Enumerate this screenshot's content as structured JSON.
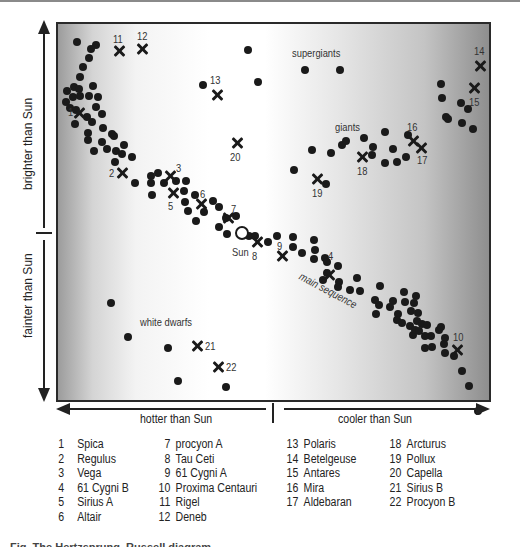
{
  "chart_data": {
    "type": "scatter",
    "title": "Hertzsprung–Russell diagram",
    "xlabel_left": "hotter than Sun",
    "xlabel_right": "cooler than Sun",
    "ylabel_top": "brighter than Sun",
    "ylabel_bottom": "fainter than Sun",
    "grid": false,
    "region_labels": [
      {
        "text": "supergiants",
        "x": 292,
        "y": 47
      },
      {
        "text": "giants",
        "x": 335,
        "y": 121
      },
      {
        "text": "white dwarfs",
        "x": 140,
        "y": 316
      },
      {
        "text": "main sequence",
        "x": 303,
        "y": 270
      }
    ],
    "sun": {
      "label": "Sun",
      "x": 242,
      "y": 233,
      "label_x": 232,
      "label_y": 246
    },
    "named_stars": [
      {
        "id": 1,
        "name": "Spica",
        "x": 79,
        "y": 113,
        "lx": 68,
        "ly": 106
      },
      {
        "id": 2,
        "name": "Regulus",
        "x": 122,
        "y": 173,
        "lx": 109,
        "ly": 167
      },
      {
        "id": 3,
        "name": "Vega",
        "x": 170,
        "y": 176,
        "lx": 176,
        "ly": 162
      },
      {
        "id": 4,
        "name": "61 Cygni B",
        "x": 329,
        "y": 275,
        "lx": 328,
        "ly": 250
      },
      {
        "id": 5,
        "name": "Sirius A",
        "x": 173,
        "y": 193,
        "lx": 168,
        "ly": 200
      },
      {
        "id": 6,
        "name": "Altair",
        "x": 201,
        "y": 204,
        "lx": 200,
        "ly": 188
      },
      {
        "id": 7,
        "name": "procyon A",
        "x": 228,
        "y": 218,
        "lx": 231,
        "ly": 203
      },
      {
        "id": 8,
        "name": "Tau Ceti",
        "x": 257,
        "y": 242,
        "lx": 252,
        "ly": 250
      },
      {
        "id": 9,
        "name": "61 Cygni A",
        "x": 282,
        "y": 256,
        "lx": 277,
        "ly": 240
      },
      {
        "id": 10,
        "name": "Proxima Centauri",
        "x": 457,
        "y": 350,
        "lx": 453,
        "ly": 331
      },
      {
        "id": 11,
        "name": "Rigel",
        "x": 119,
        "y": 51,
        "lx": 113,
        "ly": 33
      },
      {
        "id": 12,
        "name": "Deneb",
        "x": 142,
        "y": 49,
        "lx": 137,
        "ly": 30
      },
      {
        "id": 13,
        "name": "Polaris",
        "x": 217,
        "y": 95,
        "lx": 210,
        "ly": 74
      },
      {
        "id": 14,
        "name": "Betelgeuse",
        "x": 480,
        "y": 66,
        "lx": 474,
        "ly": 45
      },
      {
        "id": 15,
        "name": "Antares",
        "x": 474,
        "y": 88,
        "lx": 469,
        "ly": 96
      },
      {
        "id": 16,
        "name": "Mira",
        "x": 413,
        "y": 141,
        "lx": 407,
        "ly": 121
      },
      {
        "id": 17,
        "name": "Aldebaran",
        "x": 421,
        "y": 148,
        "lx": 417,
        "ly": 154
      },
      {
        "id": 18,
        "name": "Arcturus",
        "x": 362,
        "y": 157,
        "lx": 357,
        "ly": 165
      },
      {
        "id": 19,
        "name": "Pollux",
        "x": 317,
        "y": 179,
        "lx": 312,
        "ly": 187
      },
      {
        "id": 20,
        "name": "Capella",
        "x": 237,
        "y": 143,
        "lx": 230,
        "ly": 151
      },
      {
        "id": 21,
        "name": "Sirius B",
        "x": 197,
        "y": 346,
        "lx": 205,
        "ly": 340
      },
      {
        "id": 22,
        "name": "Procyon B",
        "x": 218,
        "y": 367,
        "lx": 226,
        "ly": 361
      }
    ],
    "other_stars": [
      [
        77,
        42
      ],
      [
        96,
        45
      ],
      [
        91,
        49
      ],
      [
        89,
        58
      ],
      [
        83,
        67
      ],
      [
        80,
        77
      ],
      [
        74,
        87
      ],
      [
        67,
        91
      ],
      [
        79,
        89
      ],
      [
        93,
        86
      ],
      [
        66,
        102
      ],
      [
        73,
        97
      ],
      [
        80,
        96
      ],
      [
        89,
        96
      ],
      [
        98,
        97
      ],
      [
        70,
        108
      ],
      [
        76,
        110
      ],
      [
        96,
        107
      ],
      [
        102,
        114
      ],
      [
        87,
        117
      ],
      [
        92,
        122
      ],
      [
        75,
        124
      ],
      [
        88,
        133
      ],
      [
        103,
        128
      ],
      [
        112,
        134
      ],
      [
        88,
        140
      ],
      [
        102,
        142
      ],
      [
        114,
        136
      ],
      [
        94,
        151
      ],
      [
        107,
        149
      ],
      [
        116,
        151
      ],
      [
        124,
        145
      ],
      [
        122,
        154
      ],
      [
        132,
        157
      ],
      [
        115,
        162
      ],
      [
        135,
        183
      ],
      [
        151,
        176
      ],
      [
        158,
        173
      ],
      [
        151,
        183
      ],
      [
        164,
        183
      ],
      [
        176,
        181
      ],
      [
        186,
        181
      ],
      [
        184,
        191
      ],
      [
        195,
        195
      ],
      [
        152,
        195
      ],
      [
        185,
        202
      ],
      [
        213,
        201
      ],
      [
        188,
        211
      ],
      [
        204,
        212
      ],
      [
        219,
        207
      ],
      [
        226,
        218
      ],
      [
        236,
        216
      ],
      [
        196,
        221
      ],
      [
        219,
        227
      ],
      [
        227,
        234
      ],
      [
        249,
        236
      ],
      [
        255,
        236
      ],
      [
        277,
        236
      ],
      [
        268,
        242
      ],
      [
        293,
        237
      ],
      [
        293,
        247
      ],
      [
        302,
        253
      ],
      [
        315,
        250
      ],
      [
        314,
        259
      ],
      [
        314,
        240
      ],
      [
        325,
        258
      ],
      [
        327,
        262
      ],
      [
        327,
        273
      ],
      [
        323,
        280
      ],
      [
        338,
        266
      ],
      [
        339,
        282
      ],
      [
        338,
        287
      ],
      [
        350,
        290
      ],
      [
        357,
        278
      ],
      [
        360,
        291
      ],
      [
        380,
        286
      ],
      [
        379,
        305
      ],
      [
        393,
        301
      ],
      [
        404,
        292
      ],
      [
        416,
        296
      ],
      [
        375,
        300
      ],
      [
        376,
        314
      ],
      [
        390,
        307
      ],
      [
        398,
        314
      ],
      [
        405,
        302
      ],
      [
        414,
        303
      ],
      [
        411,
        311
      ],
      [
        418,
        313
      ],
      [
        417,
        321
      ],
      [
        422,
        324
      ],
      [
        427,
        325
      ],
      [
        413,
        335
      ],
      [
        431,
        336
      ],
      [
        439,
        330
      ],
      [
        441,
        327
      ],
      [
        445,
        338
      ],
      [
        444,
        344
      ],
      [
        432,
        347
      ],
      [
        425,
        348
      ],
      [
        445,
        353
      ],
      [
        425,
        336
      ],
      [
        397,
        320
      ],
      [
        402,
        323
      ],
      [
        410,
        326
      ],
      [
        415,
        330
      ],
      [
        419,
        331
      ],
      [
        454,
        356
      ],
      [
        462,
        371
      ],
      [
        469,
        386
      ],
      [
        248,
        50
      ],
      [
        203,
        85
      ],
      [
        258,
        82
      ],
      [
        305,
        70
      ],
      [
        340,
        70
      ],
      [
        441,
        84
      ],
      [
        442,
        98
      ],
      [
        461,
        103
      ],
      [
        448,
        119
      ],
      [
        446,
        117
      ],
      [
        468,
        109
      ],
      [
        462,
        123
      ],
      [
        473,
        129
      ],
      [
        312,
        150
      ],
      [
        342,
        145
      ],
      [
        331,
        153
      ],
      [
        346,
        141
      ],
      [
        364,
        138
      ],
      [
        385,
        132
      ],
      [
        373,
        147
      ],
      [
        372,
        155
      ],
      [
        393,
        149
      ],
      [
        385,
        163
      ],
      [
        397,
        162
      ],
      [
        406,
        157
      ],
      [
        294,
        170
      ],
      [
        326,
        184
      ],
      [
        408,
        135
      ],
      [
        111,
        303
      ],
      [
        128,
        337
      ],
      [
        168,
        348
      ],
      [
        178,
        381
      ],
      [
        226,
        387
      ],
      [
        478,
        411
      ]
    ]
  },
  "legend": {
    "columns": [
      [
        {
          "num": "1",
          "name": "Spica"
        },
        {
          "num": "2",
          "name": "Regulus"
        },
        {
          "num": "3",
          "name": "Vega"
        },
        {
          "num": "4",
          "name": "61 Cygni B"
        },
        {
          "num": "5",
          "name": "Sirius A"
        },
        {
          "num": "6",
          "name": "Altair"
        }
      ],
      [
        {
          "num": "7",
          "name": "procyon A"
        },
        {
          "num": "8",
          "name": "Tau Ceti"
        },
        {
          "num": "9",
          "name": "61 Cygni A"
        },
        {
          "num": "10",
          "name": "Proxima Centauri"
        },
        {
          "num": "11",
          "name": "Rigel"
        },
        {
          "num": "12",
          "name": "Deneb"
        }
      ],
      [
        {
          "num": "13",
          "name": "Polaris"
        },
        {
          "num": "14",
          "name": "Betelgeuse"
        },
        {
          "num": "15",
          "name": "Antares"
        },
        {
          "num": "16",
          "name": "Mira"
        },
        {
          "num": "17",
          "name": "Aldebaran"
        }
      ],
      [
        {
          "num": "18",
          "name": "Arcturus"
        },
        {
          "num": "19",
          "name": "Pollux"
        },
        {
          "num": "20",
          "name": "Capella"
        },
        {
          "num": "21",
          "name": "Sirius B"
        },
        {
          "num": "22",
          "name": "Procyon B"
        }
      ]
    ]
  },
  "axes": {
    "brighter": "brighter than Sun",
    "fainter": "fainter than Sun",
    "hotter": "hotter than Sun",
    "cooler": "cooler than Sun"
  },
  "caption": "Fig. The Hertzsprung–Russell diagram"
}
